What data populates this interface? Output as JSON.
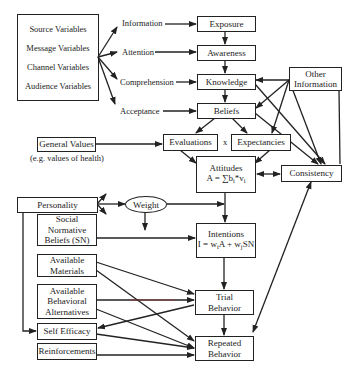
{
  "diagram": {
    "source_box": {
      "items": [
        "Source Variables",
        "Message Variables",
        "Channel Variables",
        "Audience Variables"
      ]
    },
    "process_labels": {
      "information": "Information",
      "attention": "Attention",
      "comprehension": "Comprehension",
      "acceptance": "Acceptance"
    },
    "chain": {
      "exposure": "Exposure",
      "awareness": "Awareness",
      "knowledge": "Knowledge",
      "beliefs": "Beliefs"
    },
    "other_information": {
      "line1": "Other",
      "line2": "Information"
    },
    "general_values": {
      "label": "General Values",
      "note": "(e.g. values of health)"
    },
    "evaluations": "Evaluations",
    "times_symbol": "x",
    "expectancies": "Expectancies",
    "attitudes": {
      "title": "Attitudes",
      "formula_lhs": "A = ∑b",
      "formula_i1": "i",
      "formula_mid": "*v",
      "formula_i2": "i"
    },
    "consistency": "Consistency",
    "personality": "Personality",
    "weight": "Weight",
    "social_normative": {
      "line1": "Social",
      "line2": "Normative",
      "line3": "Beliefs (SN)"
    },
    "intentions": {
      "title": "Intentions",
      "f1": "I = w",
      "s1": "i",
      "f2": "A + w",
      "s2": "j",
      "f3": "SN"
    },
    "available_materials": {
      "line1": "Available",
      "line2": "Materials"
    },
    "available_alternatives": {
      "line1": "Available",
      "line2": "Behavioral",
      "line3": "Alternatives"
    },
    "self_efficacy": "Self Efficacy",
    "reinforcements": "Reinforcements",
    "trial_behavior": {
      "line1": "Trial",
      "line2": "Behavior"
    },
    "repeated_behavior": {
      "line1": "Repeated",
      "line2": "Behavior"
    }
  },
  "colors": {
    "line": "#222222",
    "background": "#ffffff",
    "accent_line": "#b03030"
  }
}
